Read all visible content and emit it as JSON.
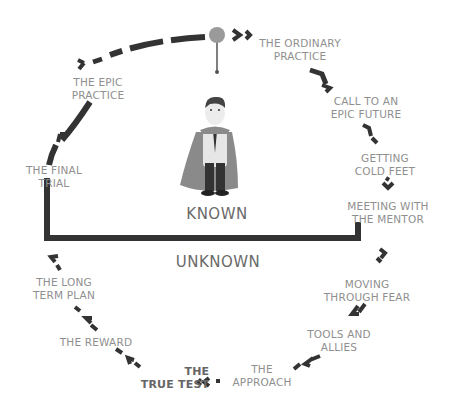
{
  "diagram": {
    "colors": {
      "path": "#333333",
      "label": "#8f8f8f",
      "zone_label": "#6a6a6a",
      "start_dot": "#999999"
    },
    "zones": {
      "known": "KNOWN",
      "unknown": "UNKNOWN"
    },
    "stages": [
      {
        "line1": "THE ORDINARY",
        "line2": "PRACTICE"
      },
      {
        "line1": "CALL TO AN",
        "line2": "EPIC FUTURE"
      },
      {
        "line1": "GETTING",
        "line2": "COLD FEET"
      },
      {
        "line1": "MEETING WITH",
        "line2": "THE MENTOR"
      },
      {
        "line1": "MOVING",
        "line2": "THROUGH FEAR"
      },
      {
        "line1": "TOOLS AND",
        "line2": "ALLIES"
      },
      {
        "line1": "THE",
        "line2": "APPROACH"
      },
      {
        "line1": "THE",
        "line2": "TRUE TEST"
      },
      {
        "line1": "THE REWARD",
        "line2": ""
      },
      {
        "line1": "THE LONG",
        "line2": "TERM PLAN"
      },
      {
        "line1": "THE FINAL",
        "line2": "TRIAL"
      },
      {
        "line1": "THE EPIC",
        "line2": "PRACTICE"
      }
    ],
    "center_figure": "hero-with-cape"
  }
}
